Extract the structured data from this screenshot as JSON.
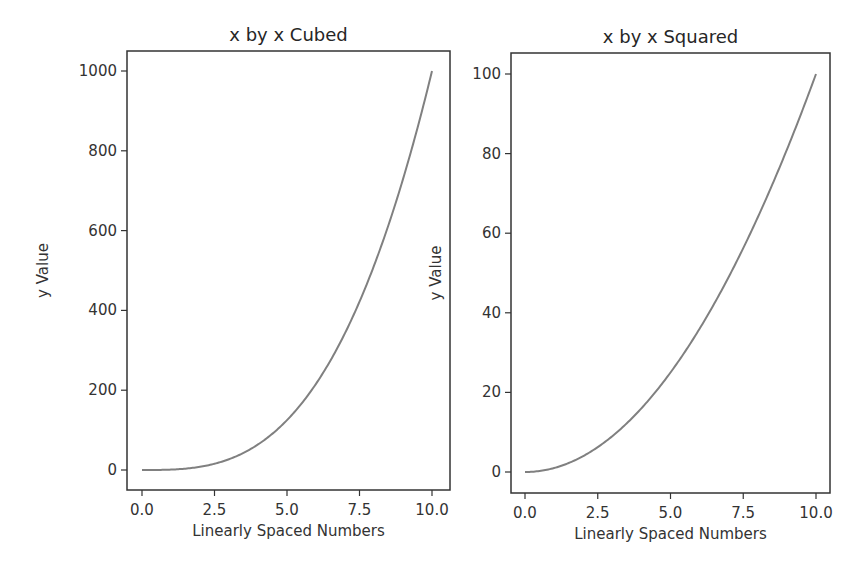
{
  "chart_data": [
    {
      "type": "line",
      "title": "x by x Cubed",
      "xlabel": "Linearly Spaced Numbers",
      "ylabel": "y Value",
      "xlim": [
        -0.5,
        10.5
      ],
      "ylim": [
        -50,
        1050
      ],
      "xticks": [
        0.0,
        2.5,
        5.0,
        7.5,
        10.0
      ],
      "xtick_labels": [
        "0.0",
        "2.5",
        "5.0",
        "7.5",
        "10.0"
      ],
      "yticks": [
        0,
        200,
        400,
        600,
        800,
        1000
      ],
      "ytick_labels": [
        "0",
        "200",
        "400",
        "600",
        "800",
        "1000"
      ],
      "grid": false,
      "series": [
        {
          "name": "x^3",
          "color": "#808080",
          "x": [
            0,
            1,
            2,
            3,
            4,
            5,
            6,
            7,
            8,
            9,
            10
          ],
          "y": [
            0,
            1,
            8,
            27,
            64,
            125,
            216,
            343,
            512,
            729,
            1000
          ]
        }
      ]
    },
    {
      "type": "line",
      "title": "x by x Squared",
      "xlabel": "Linearly Spaced Numbers",
      "ylabel": "y Value",
      "xlim": [
        -0.5,
        10.5
      ],
      "ylim": [
        -5,
        105
      ],
      "xticks": [
        0.0,
        2.5,
        5.0,
        7.5,
        10.0
      ],
      "xtick_labels": [
        "0.0",
        "2.5",
        "5.0",
        "7.5",
        "10.0"
      ],
      "yticks": [
        0,
        20,
        40,
        60,
        80,
        100
      ],
      "ytick_labels": [
        "0",
        "20",
        "40",
        "60",
        "80",
        "100"
      ],
      "grid": false,
      "series": [
        {
          "name": "x^2",
          "color": "#808080",
          "x": [
            0,
            1,
            2,
            3,
            4,
            5,
            6,
            7,
            8,
            9,
            10
          ],
          "y": [
            0,
            1,
            4,
            9,
            16,
            25,
            36,
            49,
            64,
            81,
            100
          ]
        }
      ]
    }
  ],
  "layout": {
    "panels": [
      {
        "box": {
          "x0": 127,
          "y0": 51,
          "x1": 450,
          "y1": 490
        },
        "px_x": [
          142,
          432
        ],
        "px_y": [
          470,
          71
        ]
      },
      {
        "box": {
          "x0": 511,
          "y0": 53,
          "x1": 830,
          "y1": 493
        },
        "px_x": [
          525,
          816
        ],
        "px_y": [
          472,
          74
        ]
      }
    ]
  }
}
